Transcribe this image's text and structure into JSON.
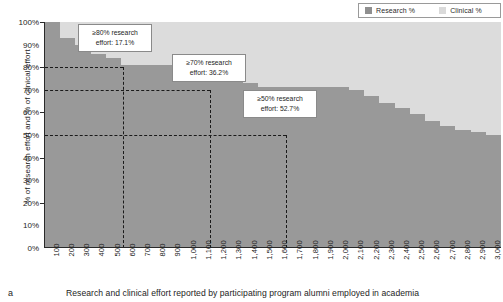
{
  "legend": {
    "items": [
      {
        "label": "Research %",
        "color": "#8f8f8f",
        "name": "research"
      },
      {
        "label": "Clinical %",
        "color": "#dadada",
        "name": "clinical"
      }
    ]
  },
  "axes": {
    "ylabel": "% of research effort and % of clinical effort",
    "yticks": [
      "0%",
      "10%",
      "20%",
      "30%",
      "40%",
      "50%",
      "60%",
      "70%",
      "80%",
      "90%",
      "100%"
    ]
  },
  "callouts": [
    {
      "line1": "≥80% research",
      "line2": "effort: 17.1%"
    },
    {
      "line1": "≥70% research",
      "line2": "effort: 36.2%"
    },
    {
      "line1": "≥50% research",
      "line2": "effort: 52.7%"
    }
  ],
  "caption": {
    "panel_letter": "a",
    "text": "Research and clinical effort reported by participating program alumni employed in academia"
  },
  "chart_data": {
    "type": "bar",
    "stacked": true,
    "title": "Research and clinical effort reported by participating program alumni employed in academia",
    "xlabel": "",
    "ylabel": "% of research effort and % of clinical effort",
    "ylim": [
      0,
      100
    ],
    "grid": false,
    "legend_position": "top-right",
    "categories": [
      "100",
      "200",
      "300",
      "400",
      "500",
      "600",
      "700",
      "800",
      "900",
      "1,000",
      "1,100",
      "1,200",
      "1,300",
      "1,400",
      "1,500",
      "1,600",
      "1,700",
      "1,800",
      "1,900",
      "2,000",
      "2,100",
      "2,200",
      "2,300",
      "2,400",
      "2,500",
      "2,600",
      "2,700",
      "2,800",
      "2,900",
      "3,000"
    ],
    "series": [
      {
        "name": "Research %",
        "color": "#999999",
        "values": [
          100,
          93,
          90,
          86,
          84,
          81,
          81,
          81,
          81,
          81,
          80,
          77,
          75,
          73,
          71,
          71,
          71,
          71,
          71,
          71,
          70,
          67,
          64,
          62,
          59,
          56,
          54,
          52,
          51,
          50
        ]
      },
      {
        "name": "Clinical %",
        "color": "#dcdcdc",
        "values": [
          0,
          7,
          10,
          14,
          16,
          19,
          19,
          19,
          19,
          19,
          20,
          23,
          25,
          27,
          29,
          29,
          29,
          29,
          29,
          29,
          30,
          33,
          36,
          38,
          41,
          44,
          46,
          48,
          49,
          50
        ]
      }
    ],
    "annotations": [
      {
        "text": "≥80% research effort: 17.1%",
        "threshold_pct": 80,
        "share_pct": 17.1
      },
      {
        "text": "≥70% research effort: 36.2%",
        "threshold_pct": 70,
        "share_pct": 36.2
      },
      {
        "text": "≥50% research effort: 52.7%",
        "threshold_pct": 50,
        "share_pct": 52.7
      }
    ],
    "guides": {
      "horizontal_pct": [
        80,
        70,
        50
      ],
      "vertical_x_fraction": [
        0.171,
        0.362,
        0.527
      ]
    }
  }
}
